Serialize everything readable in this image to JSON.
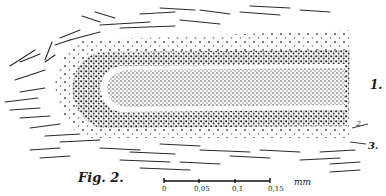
{
  "figure": {
    "caption": "Fig. 2.",
    "labels": {
      "one": "1.",
      "two": "2.",
      "three": "3."
    },
    "scale_bar": {
      "ticks": [
        "0",
        "0,05",
        "0,1",
        "0,15"
      ],
      "unit": "mm"
    },
    "colors": {
      "ink": "#1a1a1a",
      "paper": "#ffffff"
    }
  }
}
